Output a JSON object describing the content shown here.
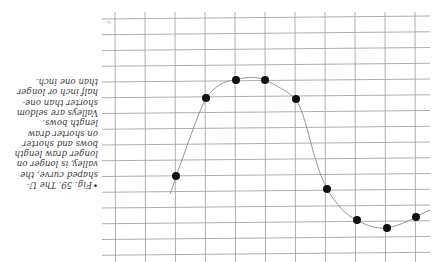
{
  "figure": {
    "orientation": "rotated 180 degrees",
    "caption_lines": [
      "Fig. 59. The U-",
      "shaped curve, the",
      "valley, is longer on",
      "longer draw length",
      "bows and shorter",
      "on shorter draw",
      "length bows.",
      "Valleys are seldom",
      "shorter than one-",
      "half inch or longer",
      "than one inch."
    ],
    "bullet": "•",
    "colors": {
      "grid": "#9a9a9a",
      "curve": "#8a8a8a",
      "points": "#111111",
      "text": "#3a3a3a",
      "background": "#ffffff"
    }
  },
  "chart_data": {
    "type": "scatter",
    "xlabel": "",
    "ylabel": "",
    "grid": true,
    "note": "Image is upside down; values given in grid units as displayed (x = column index from left, y = row index from top).",
    "grid_columns": 11,
    "grid_rows": 16,
    "points_display_px": [
      [
        176,
        176
      ],
      [
        206,
        98
      ],
      [
        236,
        80
      ],
      [
        265,
        80
      ],
      [
        296,
        99
      ],
      [
        327,
        189
      ],
      [
        357,
        220
      ],
      [
        387,
        228
      ],
      [
        416,
        217
      ]
    ],
    "points_upright_grid": [
      {
        "x": 0.5,
        "y": 2.6
      },
      {
        "x": 1.5,
        "y": 3.2
      },
      {
        "x": 2.5,
        "y": 4.5
      },
      {
        "x": 3.5,
        "y": 9.0
      },
      {
        "x": 4.5,
        "y": 10.9
      },
      {
        "x": 5.5,
        "y": 11.1
      },
      {
        "x": 6.5,
        "y": 10.0
      },
      {
        "x": 7.5,
        "y": 5.3
      },
      {
        "x": 8.5,
        "y": 1.2
      }
    ],
    "curve": "smooth U-shaped curve (inverted hump when displayed) through all points"
  }
}
